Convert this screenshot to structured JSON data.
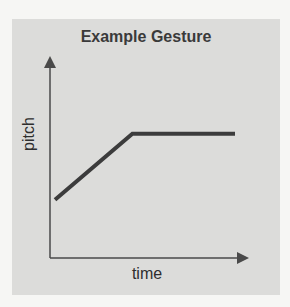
{
  "chart_data": {
    "type": "line",
    "title": "Example Gesture",
    "xlabel": "time",
    "ylabel": "pitch",
    "grid": false,
    "legend": null,
    "x": [
      0,
      0.43,
      1.0
    ],
    "series": [
      {
        "name": "pitch contour",
        "values": [
          0.3,
          0.64,
          0.64
        ]
      }
    ],
    "xlim": [
      0,
      1.1
    ],
    "ylim": [
      0,
      1.0
    ],
    "axes_style": "arrowed, no ticks"
  },
  "colors": {
    "line": "#3c3c3c",
    "axis": "#4a4a4a",
    "panel": "#dcdcda"
  }
}
